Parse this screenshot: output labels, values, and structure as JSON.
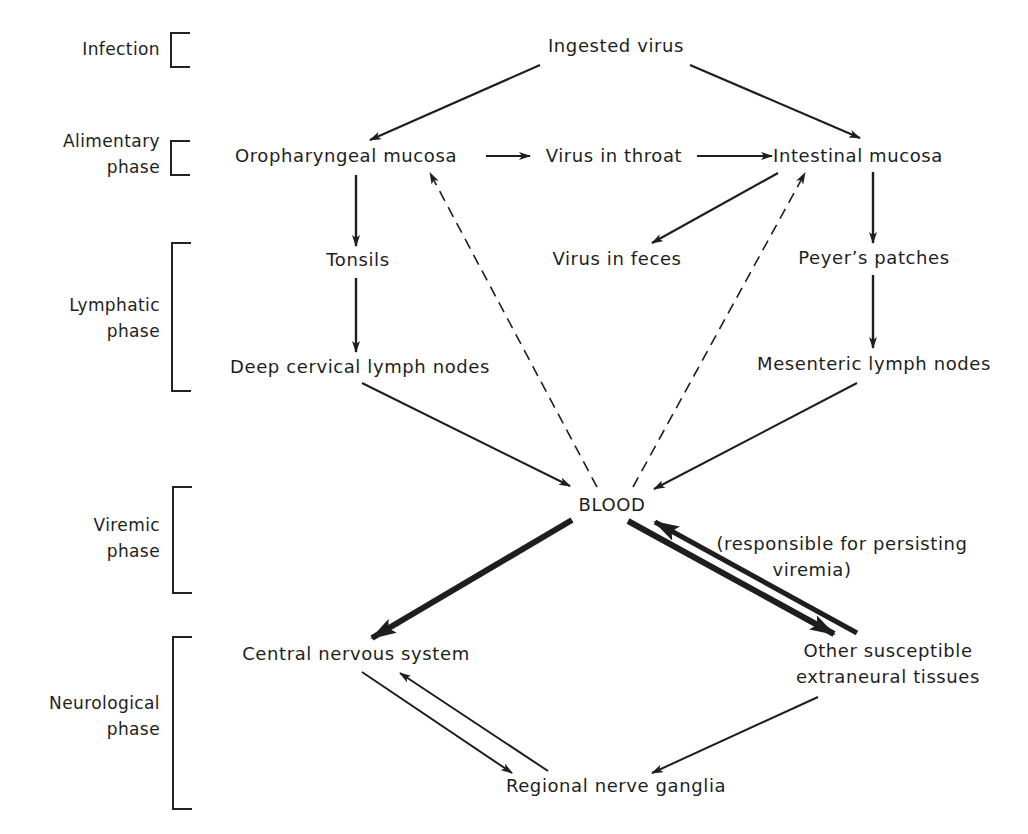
{
  "phases": [
    {
      "id": "infection",
      "lines": [
        "Infection"
      ]
    },
    {
      "id": "alimentary",
      "lines": [
        "Alimentary",
        "phase"
      ]
    },
    {
      "id": "lymphatic",
      "lines": [
        "Lymphatic",
        "phase"
      ]
    },
    {
      "id": "viremic",
      "lines": [
        "Viremic",
        "phase"
      ]
    },
    {
      "id": "neurological",
      "lines": [
        "Neurological",
        "phase"
      ]
    }
  ],
  "nodes": {
    "ingested_virus": "Ingested virus",
    "oropharyngeal_mucosa": "Oropharyngeal mucosa",
    "virus_in_throat": "Virus in throat",
    "intestinal_mucosa": "Intestinal mucosa",
    "tonsils": "Tonsils",
    "virus_in_feces": "Virus in feces",
    "peyers_patches": "Peyer’s patches",
    "deep_cervical_lymph_nodes": "Deep cervical lymph nodes",
    "mesenteric_lymph_nodes": "Mesenteric lymph nodes",
    "blood": "BLOOD",
    "central_nervous_system": "Central nervous system",
    "other_tissues_line1": "Other susceptible",
    "other_tissues_line2": "extraneural tissues",
    "regional_nerve_ganglia": "Regional nerve ganglia"
  },
  "annotations": {
    "persisting_viremia_line1": "(responsible for persisting",
    "persisting_viremia_line2": "viremia)"
  },
  "edges": [
    {
      "from": "ingested_virus",
      "to": "oropharyngeal_mucosa",
      "style": "solid"
    },
    {
      "from": "ingested_virus",
      "to": "intestinal_mucosa",
      "style": "solid"
    },
    {
      "from": "oropharyngeal_mucosa",
      "to": "virus_in_throat",
      "style": "solid"
    },
    {
      "from": "virus_in_throat",
      "to": "intestinal_mucosa",
      "style": "solid"
    },
    {
      "from": "oropharyngeal_mucosa",
      "to": "tonsils",
      "style": "solid"
    },
    {
      "from": "tonsils",
      "to": "deep_cervical_lymph_nodes",
      "style": "solid"
    },
    {
      "from": "intestinal_mucosa",
      "to": "virus_in_feces",
      "style": "solid"
    },
    {
      "from": "intestinal_mucosa",
      "to": "peyers_patches",
      "style": "solid"
    },
    {
      "from": "peyers_patches",
      "to": "mesenteric_lymph_nodes",
      "style": "solid"
    },
    {
      "from": "deep_cervical_lymph_nodes",
      "to": "blood",
      "style": "solid"
    },
    {
      "from": "mesenteric_lymph_nodes",
      "to": "blood",
      "style": "solid"
    },
    {
      "from": "blood",
      "to": "oropharyngeal_mucosa",
      "style": "dashed"
    },
    {
      "from": "blood",
      "to": "intestinal_mucosa",
      "style": "dashed"
    },
    {
      "from": "blood",
      "to": "central_nervous_system",
      "style": "bold"
    },
    {
      "from": "blood",
      "to": "other_tissues",
      "style": "bold"
    },
    {
      "from": "other_tissues",
      "to": "blood",
      "style": "bold"
    },
    {
      "from": "central_nervous_system",
      "to": "regional_nerve_ganglia",
      "style": "solid"
    },
    {
      "from": "regional_nerve_ganglia",
      "to": "central_nervous_system",
      "style": "solid"
    },
    {
      "from": "other_tissues",
      "to": "regional_nerve_ganglia",
      "style": "solid"
    }
  ],
  "colors": {
    "ink": "#1e1e1e",
    "background": "#ffffff"
  }
}
